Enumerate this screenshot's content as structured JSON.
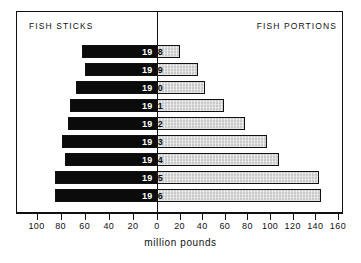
{
  "chart_data": {
    "type": "bar",
    "orientation": "horizontal-diverging",
    "title": "",
    "xlabel": "million pounds",
    "ylabel": "",
    "categories": [
      "1958",
      "1959",
      "1960",
      "1961",
      "1962",
      "1963",
      "1964",
      "1965",
      "1966"
    ],
    "series": [
      {
        "name": "FISH STICKS",
        "side": "left",
        "color": "#0b0b0b",
        "values": [
          62,
          60,
          67,
          72,
          74,
          79,
          76,
          85,
          85
        ]
      },
      {
        "name": "FISH PORTIONS",
        "side": "right",
        "color": "#c9c9c9",
        "values": [
          20,
          36,
          42,
          59,
          78,
          97,
          108,
          143,
          145
        ]
      }
    ],
    "xlim": [
      -100,
      160
    ],
    "xticks_left": [
      100,
      80,
      60,
      40,
      20
    ],
    "xticks_center": [
      0
    ],
    "xticks_right": [
      20,
      40,
      60,
      80,
      100,
      120,
      140,
      160
    ],
    "grid": false,
    "legend": "panel-headers",
    "axis_color": "#111111"
  },
  "panels": {
    "left_title": "FISH STICKS",
    "right_title": "FISH PORTIONS"
  },
  "axis": {
    "title": "million pounds",
    "tick_labels": [
      "100",
      "80",
      "60",
      "40",
      "20",
      "0",
      "20",
      "40",
      "60",
      "80",
      "100",
      "120",
      "140",
      "160"
    ]
  },
  "bar_labels": [
    {
      "left": "19",
      "right": "58"
    },
    {
      "left": "19",
      "right": "59"
    },
    {
      "left": "19",
      "right": "60"
    },
    {
      "left": "19",
      "right": "61"
    },
    {
      "left": "19",
      "right": "62"
    },
    {
      "left": "19",
      "right": "63"
    },
    {
      "left": "19",
      "right": "64"
    },
    {
      "left": "19",
      "right": "65"
    },
    {
      "left": "19",
      "right": "66"
    }
  ]
}
